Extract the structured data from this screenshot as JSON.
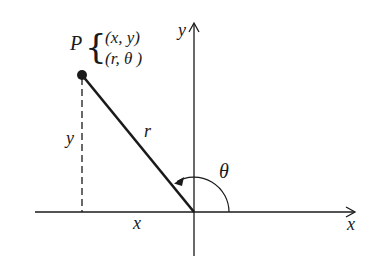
{
  "diagram": {
    "point": {
      "label": "P",
      "rect_coords": "(x, y)",
      "polar_coords": "(r, θ )"
    },
    "labels": {
      "x_axis": "x",
      "y_axis": "y",
      "x_distance": "x",
      "y_distance": "y",
      "radius": "r",
      "angle": "θ"
    },
    "colors": {
      "stroke": "#1a1a1a",
      "background": "#ffffff"
    }
  }
}
